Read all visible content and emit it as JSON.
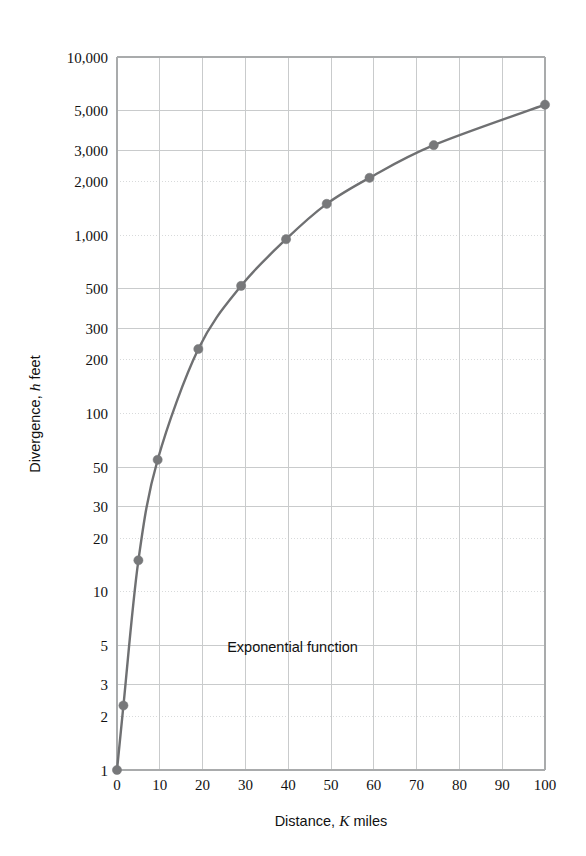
{
  "chart_data": {
    "type": "line",
    "title": "",
    "subtitle": "",
    "xlabel": "Distance, K miles",
    "xlabel_parts": {
      "pre": "Distance, ",
      "italic": "K",
      "post": " miles"
    },
    "ylabel": "Divergence, h feet",
    "ylabel_parts": {
      "pre": "Divergence, ",
      "italic": "h",
      "post": " feet"
    },
    "xscale": "linear",
    "yscale": "log",
    "xlim": [
      0,
      100
    ],
    "ylim": [
      1,
      10000
    ],
    "grid": true,
    "legend": "none",
    "annotations": [
      {
        "text": "Exponential function",
        "x": 41,
        "y": 4.6
      }
    ],
    "xticks": [
      0,
      10,
      20,
      30,
      40,
      50,
      60,
      70,
      80,
      90,
      100
    ],
    "xtick_labels": [
      "0",
      "10",
      "20",
      "30",
      "40",
      "50",
      "60",
      "70",
      "80",
      "90",
      "100"
    ],
    "yticks": [
      1,
      2,
      3,
      5,
      10,
      20,
      30,
      50,
      100,
      200,
      300,
      500,
      1000,
      2000,
      3000,
      5000,
      10000
    ],
    "ytick_labels": [
      "1",
      "2",
      "3",
      "5",
      "10",
      "20",
      "30",
      "50",
      "100",
      "200",
      "300",
      "500",
      "1,000",
      "2,000",
      "3,000",
      "5,000",
      "10,000"
    ],
    "ytick_minor_dotted": [
      2,
      10,
      20,
      100,
      200,
      1000,
      2000
    ],
    "series": [
      {
        "name": "Exponential function",
        "color": "#6f7072",
        "marker": "circle",
        "line_width": 2.4,
        "x": [
          0,
          1.5,
          5,
          9.5,
          19,
          29,
          39.5,
          49,
          59,
          74,
          100
        ],
        "y": [
          1,
          2.3,
          15,
          55,
          230,
          520,
          950,
          1500,
          2100,
          3200,
          5400
        ]
      }
    ],
    "colors": {
      "curve": "#6f7072",
      "marker": "#77787a",
      "grid_major": "#c9cbcc",
      "grid_dotted": "#d8dadb",
      "axis": "#a9abac",
      "text": "#111111",
      "background": "#ffffff"
    }
  },
  "figure": {
    "caption": ""
  }
}
